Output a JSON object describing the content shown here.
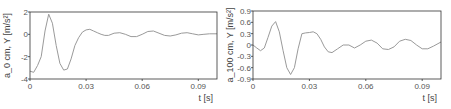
{
  "chart_data": [
    {
      "type": "line",
      "title": "",
      "xlabel": "t [s]",
      "ylabel": "a_0 cm, Y [m/s²]",
      "xlim": [
        0,
        0.1
      ],
      "ylim": [
        -4,
        2
      ],
      "xticks": [
        "0",
        "0.03",
        "0.06",
        "0.09"
      ],
      "xtick_values": [
        0,
        0.03,
        0.06,
        0.09
      ],
      "yticks": [
        "2",
        "0",
        "-2",
        "-4"
      ],
      "ytick_values": [
        2,
        0,
        -2,
        -4
      ],
      "grid": false,
      "line_color": "#9a9a9a",
      "x": [
        0,
        0.002,
        0.004,
        0.006,
        0.008,
        0.01,
        0.012,
        0.014,
        0.016,
        0.018,
        0.02,
        0.022,
        0.024,
        0.026,
        0.028,
        0.03,
        0.032,
        0.034,
        0.036,
        0.038,
        0.04,
        0.042,
        0.045,
        0.048,
        0.051,
        0.054,
        0.057,
        0.06,
        0.063,
        0.066,
        0.069,
        0.072,
        0.075,
        0.078,
        0.081,
        0.084,
        0.087,
        0.09,
        0.093,
        0.096,
        0.1
      ],
      "values": [
        -3.3,
        -3.4,
        -2.8,
        -2.0,
        0.3,
        1.8,
        1.0,
        -1.0,
        -2.6,
        -3.2,
        -3.1,
        -2.2,
        -1.0,
        -0.3,
        0.2,
        0.4,
        0.45,
        0.3,
        0.15,
        0.0,
        -0.1,
        -0.1,
        0.1,
        0.15,
        0.0,
        -0.2,
        -0.2,
        0.0,
        0.25,
        0.3,
        0.1,
        -0.1,
        -0.15,
        -0.05,
        0.1,
        0.15,
        0.05,
        -0.05,
        0.0,
        0.05,
        0.05
      ]
    },
    {
      "type": "line",
      "title": "",
      "xlabel": "t [s]",
      "ylabel": "a_100 cm, Y [m/s²]",
      "xlim": [
        0,
        0.1
      ],
      "ylim": [
        -0.9,
        0.9
      ],
      "xticks": [
        "0",
        "0.03",
        "0.06",
        "0.09"
      ],
      "xtick_values": [
        0,
        0.03,
        0.06,
        0.09
      ],
      "yticks": [
        "0.9",
        "0.6",
        "0.3",
        "0",
        "-0.3",
        "-0.6",
        "-0.9"
      ],
      "ytick_values": [
        0.9,
        0.6,
        0.3,
        0,
        -0.3,
        -0.6,
        -0.9
      ],
      "grid": false,
      "line_color": "#9a9a9a",
      "x": [
        0,
        0.002,
        0.004,
        0.006,
        0.008,
        0.01,
        0.012,
        0.014,
        0.016,
        0.018,
        0.02,
        0.022,
        0.024,
        0.026,
        0.028,
        0.03,
        0.032,
        0.034,
        0.036,
        0.038,
        0.04,
        0.042,
        0.045,
        0.048,
        0.051,
        0.054,
        0.057,
        0.06,
        0.063,
        0.066,
        0.069,
        0.072,
        0.075,
        0.078,
        0.081,
        0.084,
        0.087,
        0.09,
        0.093,
        0.096,
        0.1
      ],
      "values": [
        0.0,
        -0.08,
        -0.15,
        -0.08,
        0.2,
        0.5,
        0.62,
        0.35,
        -0.15,
        -0.6,
        -0.78,
        -0.6,
        -0.1,
        0.3,
        0.32,
        0.33,
        0.35,
        0.3,
        0.15,
        -0.05,
        -0.18,
        -0.2,
        -0.1,
        0.0,
        0.0,
        -0.08,
        0.0,
        0.1,
        0.13,
        0.05,
        -0.1,
        -0.12,
        -0.05,
        0.1,
        0.15,
        0.12,
        0.0,
        -0.1,
        -0.1,
        -0.03,
        0.08
      ]
    }
  ]
}
